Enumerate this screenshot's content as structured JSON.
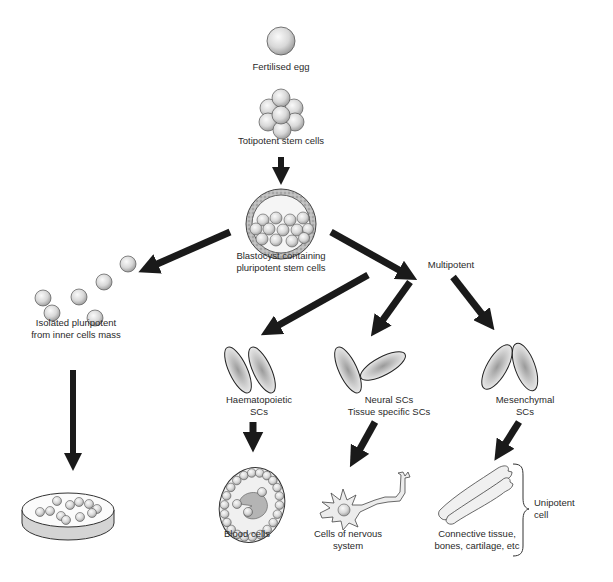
{
  "diagram": {
    "nodes": {
      "fertilised_egg": {
        "label": "Fertilised egg"
      },
      "totipotent": {
        "label": "Totipotent stem cells"
      },
      "blastocyst": {
        "label_line1": "Blastocyst containing",
        "label_line2": "pluripotent stem cells"
      },
      "isolated_pluripotent": {
        "label_line1": "Isolated pluripotent",
        "label_line2": "from inner cells mass"
      },
      "culture_dish": {
        "label": ""
      },
      "multipotent": {
        "label": "Multipotent"
      },
      "haematopoietic": {
        "label_line1": "Haematopoietic",
        "label_line2": "SCs"
      },
      "neural": {
        "label_line1": "Neural SCs",
        "label_line2": "Tissue specific SCs"
      },
      "mesenchymal": {
        "label_line1": "Mesenchymal",
        "label_line2": "SCs"
      },
      "blood_cells": {
        "label": "Blood cells"
      },
      "nervous_cells": {
        "label_line1": "Cells of nervous",
        "label_line2": "system"
      },
      "connective": {
        "label_line1": "Connective tissue,",
        "label_line2": "bones, cartilage, etc"
      },
      "unipotent": {
        "label_line1": "Unipotent",
        "label_line2": "cell"
      }
    },
    "edges": [
      {
        "from": "totipotent",
        "to": "blastocyst"
      },
      {
        "from": "blastocyst",
        "to": "isolated_pluripotent"
      },
      {
        "from": "blastocyst",
        "to": "multipotent"
      },
      {
        "from": "isolated_pluripotent",
        "to": "culture_dish"
      },
      {
        "from": "multipotent",
        "to": "haematopoietic"
      },
      {
        "from": "multipotent",
        "to": "neural"
      },
      {
        "from": "multipotent",
        "to": "mesenchymal"
      },
      {
        "from": "haematopoietic",
        "to": "blood_cells"
      },
      {
        "from": "neural",
        "to": "nervous_cells"
      },
      {
        "from": "mesenchymal",
        "to": "connective"
      }
    ],
    "colors": {
      "arrow": "#1a1a1a",
      "cell_fill_light": "#f2f2f2",
      "cell_fill_dark": "#a8a8a8",
      "outline": "#222222",
      "text": "#2a2a2a"
    }
  }
}
